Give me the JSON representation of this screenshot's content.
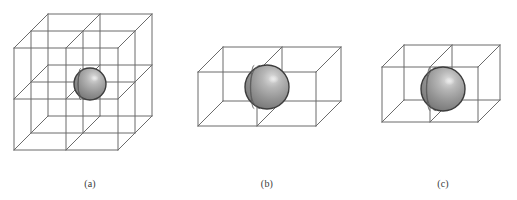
{
  "figure": {
    "background_color": "#ffffff",
    "width": 517,
    "height": 200,
    "line_color": "#6b6b6b",
    "line_width": 1,
    "sphere": {
      "outline_color": "#3d3d3d",
      "base_color": "#9a9a9a",
      "shade_dark": "#6f6f6f",
      "shade_light": "#d0d0d0",
      "highlight_color": "#e6e6e6",
      "meridian_color": "#5a5a5a"
    },
    "panels": [
      {
        "id": "panel-a",
        "label": "(a)",
        "label_x": 90,
        "label_y": 178,
        "grid": {
          "nx": 2,
          "ny": 2,
          "nz": 2
        },
        "box": {
          "front_left": 14,
          "front_top": 48,
          "front_width": 104,
          "front_height": 102,
          "depth_dx": 34,
          "depth_dy": -34
        },
        "sphere_center_x": 90,
        "sphere_center_y": 84,
        "sphere_radius": 16
      },
      {
        "id": "panel-b",
        "label": "(b)",
        "label_x": 267,
        "label_y": 178,
        "grid": {
          "nx": 2,
          "ny": 1,
          "nz": 1
        },
        "box": {
          "front_left": 198,
          "front_top": 72,
          "front_width": 118,
          "front_height": 54,
          "depth_dx": 25,
          "depth_dy": -25
        },
        "sphere_center_x": 267,
        "sphere_center_y": 87,
        "sphere_radius": 22
      },
      {
        "id": "panel-c",
        "label": "(c)",
        "label_x": 443,
        "label_y": 178,
        "grid": {
          "nx": 2,
          "ny": 1,
          "nz": 1
        },
        "box": {
          "front_left": 382,
          "front_top": 67,
          "front_width": 96,
          "front_height": 55,
          "depth_dx": 22,
          "depth_dy": -22
        },
        "sphere_center_x": 443,
        "sphere_center_y": 89,
        "sphere_radius": 22
      }
    ]
  }
}
